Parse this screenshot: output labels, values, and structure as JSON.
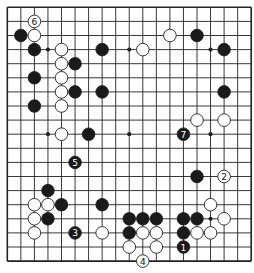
{
  "diagram": {
    "type": "go-board",
    "size": 19,
    "colors": {
      "line": "#222222",
      "black": "#1a1a1a",
      "white": "#ffffff",
      "background": "#ffffff"
    },
    "hoshi": [
      [
        3,
        3
      ],
      [
        9,
        3
      ],
      [
        15,
        3
      ],
      [
        3,
        9
      ],
      [
        9,
        9
      ],
      [
        15,
        9
      ],
      [
        3,
        15
      ],
      [
        9,
        15
      ],
      [
        15,
        15
      ]
    ],
    "black_stones": [
      [
        1,
        2
      ],
      [
        2,
        3
      ],
      [
        2,
        5
      ],
      [
        2,
        7
      ],
      [
        5,
        4
      ],
      [
        5,
        6
      ],
      [
        7,
        3
      ],
      [
        7,
        6
      ],
      [
        6,
        9
      ],
      [
        14,
        2
      ],
      [
        16,
        3
      ],
      [
        16,
        6
      ],
      [
        14,
        12
      ],
      [
        3,
        13
      ],
      [
        4,
        14
      ],
      [
        7,
        14
      ],
      [
        3,
        15
      ],
      [
        9,
        15
      ],
      [
        10,
        15
      ],
      [
        11,
        15
      ],
      [
        13,
        15
      ],
      [
        14,
        15
      ],
      [
        9,
        16
      ],
      [
        13,
        16
      ]
    ],
    "white_stones": [
      [
        2,
        2
      ],
      [
        4,
        3
      ],
      [
        4,
        4
      ],
      [
        4,
        5
      ],
      [
        4,
        6
      ],
      [
        4,
        7
      ],
      [
        4,
        9
      ],
      [
        10,
        3
      ],
      [
        12,
        2
      ],
      [
        14,
        8
      ],
      [
        16,
        8
      ],
      [
        15,
        14
      ],
      [
        16,
        15
      ],
      [
        14,
        16
      ],
      [
        15,
        16
      ],
      [
        10,
        16
      ],
      [
        11,
        16
      ],
      [
        2,
        14
      ],
      [
        3,
        14
      ],
      [
        2,
        15
      ],
      [
        2,
        16
      ],
      [
        7,
        16
      ],
      [
        9,
        17
      ],
      [
        11,
        17
      ]
    ],
    "numbered_moves": [
      {
        "number": "1",
        "color": "black",
        "col": 13,
        "row": 17
      },
      {
        "number": "2",
        "color": "white",
        "col": 16,
        "row": 12
      },
      {
        "number": "3",
        "color": "black",
        "col": 5,
        "row": 16
      },
      {
        "number": "4",
        "color": "white",
        "col": 10,
        "row": 18
      },
      {
        "number": "5",
        "color": "black",
        "col": 5,
        "row": 11
      },
      {
        "number": "6",
        "color": "white",
        "col": 2,
        "row": 1
      },
      {
        "number": "7",
        "color": "black",
        "col": 13,
        "row": 9
      }
    ]
  }
}
